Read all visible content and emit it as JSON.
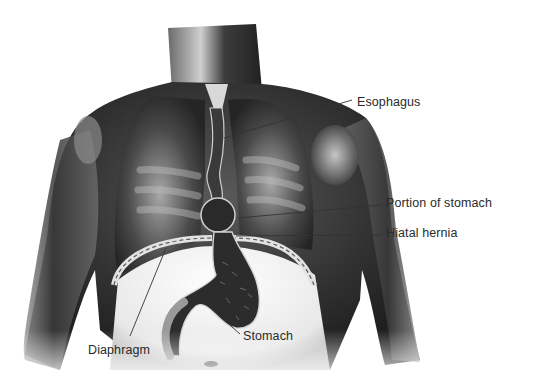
{
  "figure": {
    "colors": {
      "background": "#ffffff",
      "body_dark": "#2e2e2e",
      "body_mid": "#6b6b6b",
      "body_light": "#c9c9c9",
      "label_text": "#2a2a2a",
      "leader_line": "#333333"
    }
  },
  "labels": [
    {
      "id": "esophagus",
      "text": "Esophagus",
      "x": 357,
      "y": 96,
      "line": [
        352,
        100,
        224,
        138
      ]
    },
    {
      "id": "portion-of-stomach",
      "text": "Portion of stomach",
      "x": 386,
      "y": 197,
      "line": [
        382,
        205,
        238,
        218
      ]
    },
    {
      "id": "hiatal-hernia",
      "text": "Hiatal hernia",
      "x": 386,
      "y": 227,
      "line": [
        382,
        235,
        236,
        236
      ]
    },
    {
      "id": "stomach",
      "text": "Stomach",
      "x": 243,
      "y": 329,
      "line": [
        240,
        334,
        224,
        320
      ]
    },
    {
      "id": "diaphragm",
      "text": "Diaphragm",
      "x": 88,
      "y": 343,
      "line": [
        130,
        336,
        166,
        248
      ]
    }
  ]
}
